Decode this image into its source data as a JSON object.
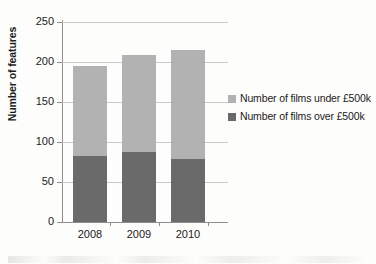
{
  "chart_data": {
    "type": "bar",
    "subtype": "stacked-bar",
    "title": "",
    "xlabel": "",
    "ylabel": "Number of features",
    "categories": [
      "2008",
      "2009",
      "2010"
    ],
    "ylim": [
      0,
      250
    ],
    "yticks": [
      0,
      50,
      100,
      150,
      200,
      250
    ],
    "ytick_labels": [
      "0",
      "50",
      "100",
      "150",
      "200",
      "250"
    ],
    "grid": true,
    "legend_position": "right",
    "series": [
      {
        "name": "Number of films over £500k",
        "values": [
          82,
          87,
          79
        ],
        "color": "#6a6a6a"
      },
      {
        "name": "Number of films under £500k",
        "values": [
          113,
          122,
          136
        ],
        "color": "#b2b2b2"
      }
    ],
    "totals": [
      195,
      209,
      215
    ]
  },
  "legend": {
    "entries": [
      {
        "label": "Number of films under £500k",
        "color": "#b2b2b2"
      },
      {
        "label": "Number of films over £500k",
        "color": "#6a6a6a"
      }
    ]
  },
  "axes": {
    "y_title": "Number of features",
    "y_tick_labels": [
      "250",
      "200",
      "150",
      "100",
      "50",
      "0"
    ],
    "x_tick_labels": [
      "2008",
      "2009",
      "2010"
    ]
  },
  "colors": {
    "under_500k": "#b2b2b2",
    "over_500k": "#6a6a6a",
    "gridline": "#c9c9c9",
    "axis": "#8e8e8e",
    "text": "#1c1c1c",
    "background": "#fdfdfb"
  }
}
